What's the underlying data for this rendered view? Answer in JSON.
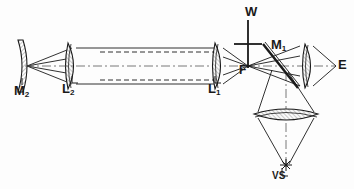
{
  "figure": {
    "background": "#fdfdfd",
    "line_color": "#1a1a1a",
    "hatch_color": "#8a8a8a",
    "axis_y": 66
  },
  "labels": {
    "m2": {
      "text": "M",
      "sub": "2",
      "name": "concave-mirror-m2"
    },
    "l2": {
      "text": "L",
      "sub": "2",
      "name": "lens-l2"
    },
    "l1": {
      "text": "L",
      "sub": "1",
      "name": "lens-l1"
    },
    "w": {
      "text": "W",
      "sub": "",
      "name": "wire-w"
    },
    "m1": {
      "text": "M",
      "sub": "1",
      "name": "beamsplitter-m1"
    },
    "f": {
      "text": "F",
      "sub": "",
      "name": "focus-f"
    },
    "e": {
      "text": "E",
      "sub": "",
      "name": "eye-e"
    },
    "vs": {
      "text": "VS",
      "sub": "",
      "name": "virtual-source-vs"
    }
  },
  "components": [
    {
      "id": "m2",
      "kind": "concave-mirror",
      "x": 22,
      "y": 66,
      "label": "M2"
    },
    {
      "id": "l2",
      "kind": "biconvex-lens",
      "x": 72,
      "y": 66,
      "label": "L2"
    },
    {
      "id": "l1",
      "kind": "biconvex-lens",
      "x": 215,
      "y": 66,
      "label": "L1"
    },
    {
      "id": "w",
      "kind": "wire-cross",
      "x": 248,
      "y": 44,
      "label": "W"
    },
    {
      "id": "f",
      "kind": "focal-point",
      "x": 248,
      "y": 66,
      "label": "F"
    },
    {
      "id": "m1",
      "kind": "tilted-beamsplitter",
      "x": 285,
      "y": 62,
      "label": "M1"
    },
    {
      "id": "l3",
      "kind": "biconvex-lens",
      "x": 308,
      "y": 66,
      "label": ""
    },
    {
      "id": "e",
      "kind": "eye-point",
      "x": 336,
      "y": 66,
      "label": "E"
    },
    {
      "id": "l4",
      "kind": "wide-lens",
      "x": 286,
      "y": 116,
      "label": ""
    },
    {
      "id": "vs",
      "kind": "source-starburst",
      "x": 286,
      "y": 166,
      "label": "VS"
    }
  ],
  "beam_paths": {
    "collimated_segment": "L2 to L1 parallel bundle with dashed inner rays",
    "left_cone": "M2 to L2 converging cone",
    "mid_cone": "L1 to F converging cone",
    "right_cone": "M1/L3 to E converging cone",
    "down_cone": "M1 reflecting down through L4 to VS"
  }
}
